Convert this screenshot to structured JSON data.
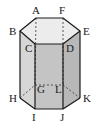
{
  "diagram": {
    "type": "geometric-solid",
    "colors": {
      "edge": "#1a1a1a",
      "hidden_edge": "#333333",
      "top_face": "#ececec",
      "left_face": "#d6d6d6",
      "front_face": "#c4c4c4",
      "right_face": "#b8b8b8",
      "background": "#ffffff"
    },
    "vertices": [
      {
        "id": "A",
        "label": "A"
      },
      {
        "id": "F",
        "label": "F"
      },
      {
        "id": "B",
        "label": "B"
      },
      {
        "id": "E",
        "label": "E"
      },
      {
        "id": "C",
        "label": "C"
      },
      {
        "id": "D",
        "label": "D"
      },
      {
        "id": "G",
        "label": "G"
      },
      {
        "id": "L",
        "label": "L"
      },
      {
        "id": "H",
        "label": "H"
      },
      {
        "id": "K",
        "label": "K"
      },
      {
        "id": "I",
        "label": "I"
      },
      {
        "id": "J",
        "label": "J"
      }
    ],
    "visible_edges": [
      "AF",
      "FE",
      "ED",
      "DC",
      "CB",
      "BA",
      "BH",
      "CI",
      "DJ",
      "EK",
      "HI",
      "IJ",
      "JK"
    ],
    "hidden_edges": [
      "AG",
      "FL",
      "HG",
      "GL",
      "LK"
    ]
  }
}
